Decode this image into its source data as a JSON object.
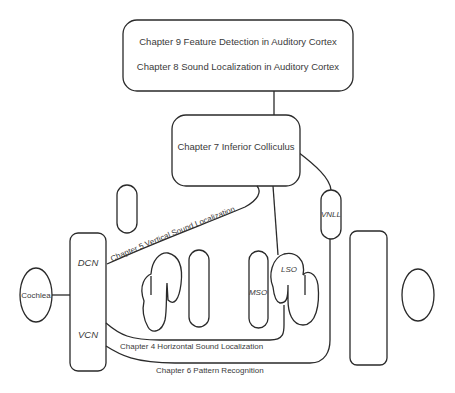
{
  "cortex_box": {
    "line1": "Chapter 9  Feature Detection in Auditory Cortex",
    "line2": "Chapter 8  Sound Localization in Auditory Cortex"
  },
  "ic_box": {
    "label": "Chapter 7 Inferior Colliculus"
  },
  "nodes": {
    "cochlea": "Cochlea",
    "dcn": "DCN",
    "vcn": "VCN",
    "mso": "MSO",
    "lso": "LSO",
    "vnll": "VNLL"
  },
  "pathways": {
    "chapter5": "Chapter 5  Vertical Sound Localization",
    "chapter4": "Chapter 4  Horizontal Sound Localization",
    "chapter6": "Chapter 6  Pattern Recognition"
  },
  "colors": {
    "stroke": "#2a2a2a",
    "text": "#3a3a3a",
    "background": "#ffffff"
  }
}
